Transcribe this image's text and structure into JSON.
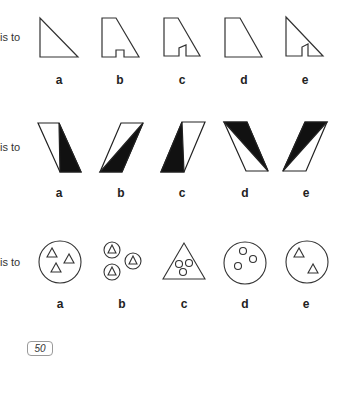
{
  "rows": [
    {
      "prefix": "is to",
      "options": [
        "a",
        "b",
        "c",
        "d",
        "e"
      ]
    },
    {
      "prefix": "is to",
      "options": [
        "a",
        "b",
        "c",
        "d",
        "e"
      ]
    },
    {
      "prefix": "is to",
      "options": [
        "a",
        "b",
        "c",
        "d",
        "e"
      ]
    }
  ],
  "page_number": "50",
  "colors": {
    "stroke": "#333333",
    "fill_dark": "#111111",
    "background": "#ffffff"
  }
}
